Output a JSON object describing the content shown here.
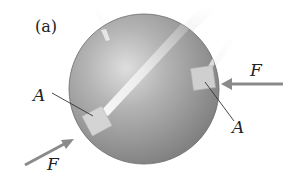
{
  "figure": {
    "panel_label": "(a)",
    "sphere": {
      "center": [
        144,
        89
      ],
      "radius": 75,
      "colors": {
        "highlight": "#d9d9d9",
        "mid": "#a8a8a8",
        "shadow": "#7c7c7c",
        "edge": "#6a6a6a"
      }
    },
    "patches": [
      {
        "name": "patch-left",
        "center": [
          97,
          121
        ],
        "size": 22,
        "rotation": -28,
        "color": "#d2d2d2"
      },
      {
        "name": "patch-right",
        "center": [
          203,
          78
        ],
        "size": 22,
        "rotation": -8,
        "color": "#cfcfcf"
      }
    ],
    "labels": {
      "point_left": "A",
      "point_right": "A",
      "force_left": "F",
      "force_right": "F"
    },
    "arrows": {
      "color": "#8a8a8a",
      "left": {
        "from": [
          25,
          165
        ],
        "to": [
          72,
          140
        ]
      },
      "right": {
        "from": [
          283,
          84
        ],
        "to": [
          222,
          84
        ]
      }
    }
  }
}
